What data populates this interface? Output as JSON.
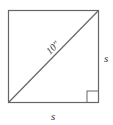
{
  "diagram": {
    "type": "square-with-diagonal",
    "diagonal_label": "10\"",
    "side_right_label": "s",
    "side_bottom_label": "s",
    "right_angle_marker": true,
    "colors": {
      "stroke": "#555555",
      "text": "#333333",
      "background": "#ffffff"
    }
  }
}
